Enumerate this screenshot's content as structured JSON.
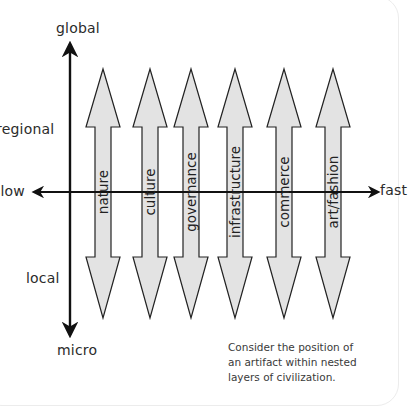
{
  "axes": {
    "vertical": {
      "top_label": "global",
      "upper_mid_label": "regional",
      "lower_mid_label": "local",
      "bottom_label": "micro"
    },
    "horizontal": {
      "left_label": "slow",
      "right_label": "fast"
    }
  },
  "layers": [
    {
      "label": "nature",
      "x": 103
    },
    {
      "label": "culture",
      "x": 150
    },
    {
      "label": "governance",
      "x": 191
    },
    {
      "label": "infrastructure",
      "x": 235
    },
    {
      "label": "commerce",
      "x": 284
    },
    {
      "label": "art/fashion",
      "x": 333
    }
  ],
  "caption": {
    "lines": [
      "Consider the position of",
      "an artifact within nested",
      "layers of civilization."
    ]
  },
  "colors": {
    "arrow_fill": "#e3e3e3",
    "arrow_stroke": "#222222",
    "axis": "#111111"
  }
}
